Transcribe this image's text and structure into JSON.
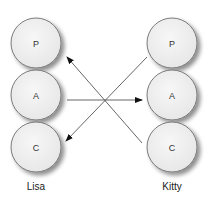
{
  "diagram": {
    "type": "role-transaction-diagram",
    "background": "#ffffff",
    "node_fill": "#f1f1f1",
    "node_stroke": "#7a7a7a",
    "arrow_color": "#555555",
    "people": [
      {
        "name": "Lisa",
        "label_x": 36,
        "label_y": 190,
        "cx": 36,
        "nodes": [
          {
            "id": "lisa-p",
            "label": "P",
            "cy": 43
          },
          {
            "id": "lisa-a",
            "label": "A",
            "cy": 95
          },
          {
            "id": "lisa-c",
            "label": "C",
            "cy": 147
          }
        ]
      },
      {
        "name": "Kitty",
        "label_x": 172,
        "label_y": 190,
        "cx": 172,
        "nodes": [
          {
            "id": "kitty-p",
            "label": "P",
            "cy": 43
          },
          {
            "id": "kitty-a",
            "label": "A",
            "cy": 95
          },
          {
            "id": "kitty-c",
            "label": "C",
            "cy": 147
          }
        ]
      }
    ],
    "node_radius": 25,
    "arrows": [
      {
        "from": "kitty-p",
        "to": "lisa-p",
        "x1": 147,
        "y1": 56,
        "x2": 66,
        "y2": 56,
        "note": "Kitty P to Lisa P diagonal (drawn to tip at left)"
      },
      {
        "from": "lisa-a",
        "to": "kitty-a",
        "x1": 67,
        "y1": 100,
        "x2": 141,
        "y2": 100
      },
      {
        "from": "kitty-c",
        "to": "lisa-c",
        "x1": 142,
        "y1": 143,
        "x2": 66,
        "y2": 141
      }
    ]
  }
}
